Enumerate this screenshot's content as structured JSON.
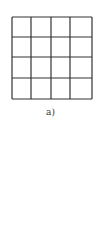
{
  "figure": {
    "caption": "a)",
    "grid": {
      "rows": 4,
      "cols": 4,
      "line_color": "#333333",
      "x_lines": [
        12,
        31,
        51,
        70,
        92
      ],
      "y_lines": [
        17,
        37,
        57,
        78,
        99
      ]
    }
  }
}
